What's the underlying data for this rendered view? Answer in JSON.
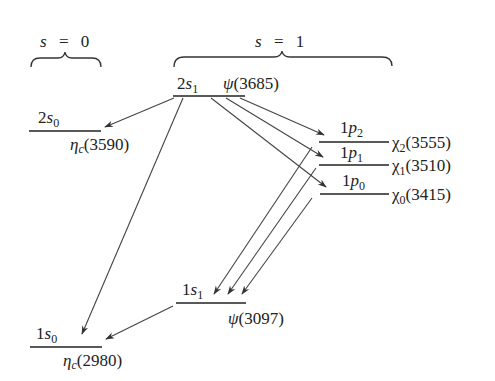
{
  "spin_groups": [
    {
      "label_var": "s",
      "label_eq": "=",
      "label_val": "0"
    },
    {
      "label_var": "s",
      "label_eq": "=",
      "label_val": "1"
    }
  ],
  "levels": {
    "2s1": {
      "n": "2",
      "l": "s",
      "sub": "1",
      "particle": "ψ",
      "particle_sub": "",
      "mass": "(3685)"
    },
    "2s0": {
      "n": "2",
      "l": "s",
      "sub": "0",
      "particle": "η",
      "particle_sub": "c",
      "mass": "(3590)"
    },
    "1p2": {
      "n": "1",
      "l": "p",
      "sub": "2",
      "particle": "χ",
      "particle_sub": "2",
      "mass": "(3555)"
    },
    "1p1": {
      "n": "1",
      "l": "p",
      "sub": "1",
      "particle": "χ",
      "particle_sub": "1",
      "mass": "(3510)"
    },
    "1p0": {
      "n": "1",
      "l": "p",
      "sub": "0",
      "particle": "χ",
      "particle_sub": "0",
      "mass": "(3415)"
    },
    "1s1": {
      "n": "1",
      "l": "s",
      "sub": "1",
      "particle": "ψ",
      "particle_sub": "",
      "mass": "(3097)"
    },
    "1s0": {
      "n": "1",
      "l": "s",
      "sub": "0",
      "particle": "η",
      "particle_sub": "c",
      "mass": "(2980)"
    }
  },
  "transitions": [
    {
      "from": "2s1",
      "to": "2s0"
    },
    {
      "from": "2s1",
      "to": "1s0"
    },
    {
      "from": "2s1",
      "to": "1p2"
    },
    {
      "from": "2s1",
      "to": "1p1"
    },
    {
      "from": "2s1",
      "to": "1p0"
    },
    {
      "from": "1p2",
      "to": "1s1"
    },
    {
      "from": "1p1",
      "to": "1s1"
    },
    {
      "from": "1p0",
      "to": "1s1"
    },
    {
      "from": "1s1",
      "to": "1s0"
    }
  ]
}
